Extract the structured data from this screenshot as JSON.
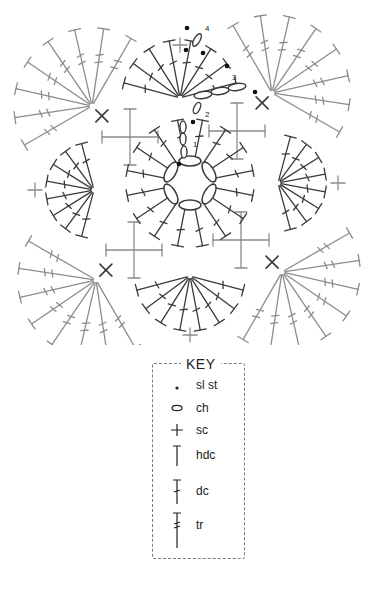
{
  "diagram": {
    "colors": {
      "dark_stitch": "#3a3a3a",
      "light_stitch": "#8c8c8c",
      "marker": "#111111",
      "background": "#ffffff"
    },
    "round_labels": [
      {
        "text": "1",
        "x": 193,
        "y": 147
      },
      {
        "text": "2",
        "x": 205,
        "y": 117
      },
      {
        "text": "3",
        "x": 232,
        "y": 80
      },
      {
        "text": "4",
        "x": 205,
        "y": 31
      }
    ],
    "center_ring": {
      "cx": 190,
      "cy": 183,
      "r": 22,
      "chains": 6
    },
    "inner_fan": {
      "cx": 190,
      "cy": 183,
      "r0": 23,
      "r1": 64,
      "spokes": 16,
      "type": "dc"
    },
    "side_fans": [
      {
        "cx": 180,
        "cy": 98,
        "start": 195,
        "end": 345,
        "n": 8,
        "r": 58,
        "type": "dc",
        "tone": "dark"
      },
      {
        "cx": 190,
        "cy": 276,
        "start": 15,
        "end": 165,
        "n": 8,
        "r": 55,
        "type": "dc",
        "tone": "dark"
      },
      {
        "cx": 94,
        "cy": 190,
        "start": 105,
        "end": 255,
        "n": 8,
        "r": 48,
        "type": "dc",
        "tone": "dark"
      },
      {
        "cx": 278,
        "cy": 183,
        "start": -75,
        "end": 75,
        "n": 8,
        "r": 48,
        "type": "dc",
        "tone": "dark"
      }
    ],
    "corner_fans": [
      {
        "cx": 92,
        "cy": 106,
        "start": 150,
        "end": 300,
        "n": 8,
        "r": 78,
        "type": "tr",
        "tone": "light"
      },
      {
        "cx": 272,
        "cy": 93,
        "start": 240,
        "end": 390,
        "n": 8,
        "r": 78,
        "type": "tr",
        "tone": "light"
      },
      {
        "cx": 96,
        "cy": 280,
        "start": 60,
        "end": 210,
        "n": 8,
        "r": 78,
        "type": "tr",
        "tone": "light"
      },
      {
        "cx": 282,
        "cy": 272,
        "start": -30,
        "end": 120,
        "n": 8,
        "r": 78,
        "type": "tr",
        "tone": "light"
      }
    ],
    "posts": [
      {
        "cx": 130,
        "cy": 137
      },
      {
        "cx": 237,
        "cy": 131
      },
      {
        "cx": 134,
        "cy": 250
      },
      {
        "cx": 241,
        "cy": 240
      }
    ],
    "edge_sc": [
      {
        "x": 35,
        "y": 190
      },
      {
        "x": 338,
        "y": 183
      },
      {
        "x": 190,
        "y": 335
      },
      {
        "x": 180,
        "y": 45
      }
    ]
  },
  "key": {
    "title": "KEY",
    "items": [
      {
        "symbol": "dot-icon",
        "label": "sl st"
      },
      {
        "symbol": "chain-icon",
        "label": "ch"
      },
      {
        "symbol": "plus-icon",
        "label": "sc"
      },
      {
        "symbol": "hdc-icon",
        "label": "hdc"
      },
      {
        "symbol": "dc-icon",
        "label": "dc"
      },
      {
        "symbol": "tr-icon",
        "label": "tr"
      }
    ]
  },
  "footer": {
    "cut_text": "..."
  }
}
